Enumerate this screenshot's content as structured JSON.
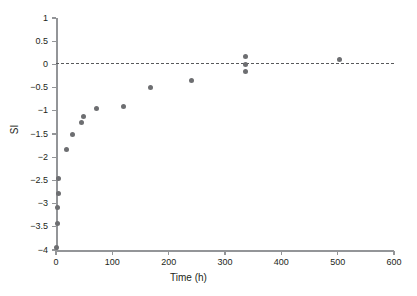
{
  "chart_data": {
    "type": "scatter",
    "title": "",
    "xlabel": "Time (h)",
    "ylabel": "SI",
    "xlim": [
      0,
      600
    ],
    "ylim": [
      -4,
      1
    ],
    "xticks": [
      0,
      100,
      200,
      300,
      400,
      500,
      600
    ],
    "xtick_labels": [
      "0",
      "100",
      "200",
      "300",
      "400",
      "500",
      "600"
    ],
    "yticks": [
      1,
      0.5,
      0,
      -0.5,
      -1,
      -1.5,
      -2,
      -2.5,
      -3,
      -3.5,
      -4
    ],
    "ytick_labels": [
      "1",
      "0.5",
      "0",
      "−0.5",
      "−1",
      "−1.5",
      "−2",
      "−2.5",
      "−3",
      "−3.5",
      "−4"
    ],
    "grid": false,
    "legend": false,
    "reference_lines": [
      {
        "name": "saturation-index-zero",
        "axis": "y",
        "value": 0,
        "style": "dashed",
        "color": "#58595b"
      }
    ],
    "marker": {
      "shape": "circle",
      "color": "#6d6e71",
      "size": 5
    },
    "series": [
      {
        "name": "SI",
        "color": "#6d6e71",
        "points": [
          {
            "x": 1,
            "y": -3.95
          },
          {
            "x": 2,
            "y": -3.42
          },
          {
            "x": 3,
            "y": -3.08
          },
          {
            "x": 4,
            "y": -2.78
          },
          {
            "x": 5,
            "y": -2.46
          },
          {
            "x": 18,
            "y": -1.83
          },
          {
            "x": 30,
            "y": -1.51
          },
          {
            "x": 46,
            "y": -1.25
          },
          {
            "x": 48,
            "y": -1.13
          },
          {
            "x": 72,
            "y": -0.95
          },
          {
            "x": 120,
            "y": -0.9
          },
          {
            "x": 168,
            "y": -0.5
          },
          {
            "x": 240,
            "y": -0.35
          },
          {
            "x": 336,
            "y": 0.17
          },
          {
            "x": 336,
            "y": 0.0
          },
          {
            "x": 336,
            "y": -0.15
          },
          {
            "x": 504,
            "y": 0.1
          }
        ]
      }
    ]
  }
}
